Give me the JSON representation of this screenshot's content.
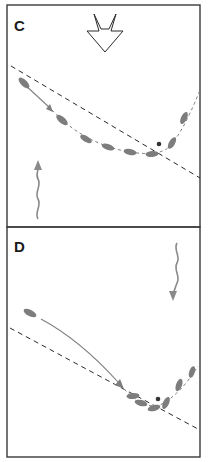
{
  "figure": {
    "panels": [
      {
        "label": "C",
        "description": "Cell trajectory curving along a dashed reference line; large open arrow pointing down at top; wavy gray arrow pointing up at lower left",
        "stimulus_arrow": "open-down-arrow",
        "gradient_arrow": "wavy-up-arrow"
      },
      {
        "label": "D",
        "description": "Cell moving along curved path toward dashed reference line, then turning upward; wavy gray arrow pointing down at upper right",
        "gradient_arrow": "wavy-down-arrow"
      }
    ],
    "colors": {
      "frame": "#3a3a3a",
      "cells": "#7d7d7d",
      "dashed_line": "#2a2a2a",
      "background": "#ffffff"
    }
  }
}
